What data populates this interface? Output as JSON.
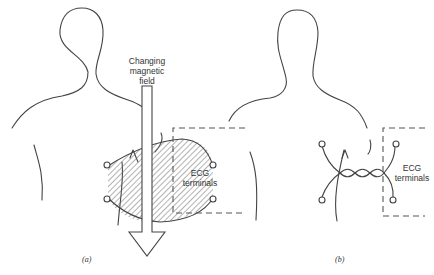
{
  "figure": {
    "panel_a": {
      "caption": "(a)",
      "field_label_line1": "Changing",
      "field_label_line2": "magnetic",
      "field_label_line3": "field",
      "terminals_label_line1": "ECG",
      "terminals_label_line2": "terminals"
    },
    "panel_b": {
      "caption": "(b)",
      "terminals_label_line1": "ECG",
      "terminals_label_line2": "terminals"
    }
  },
  "colors": {
    "line": "#444444",
    "background": "#ffffff"
  }
}
